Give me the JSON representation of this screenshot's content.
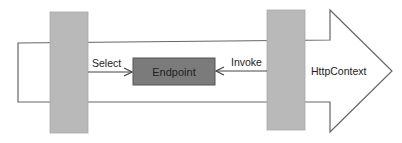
{
  "diagram": {
    "pipeline_label": "HttpContext",
    "endpoint_label": "Endpoint",
    "select_label": "Select",
    "invoke_label": "Invoke"
  },
  "colors": {
    "pillar": "#b9b9b9",
    "endpoint": "#7b7b7b",
    "stroke": "#555555"
  }
}
